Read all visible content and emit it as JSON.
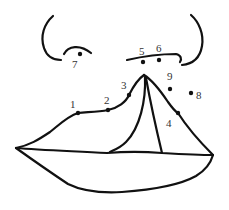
{
  "diagram": {
    "colors": {
      "line": "#111111",
      "label": "#333333",
      "background": "#ffffff"
    },
    "landmarks": [
      {
        "id": "1",
        "label": "1"
      },
      {
        "id": "2",
        "label": "2"
      },
      {
        "id": "3",
        "label": "3"
      },
      {
        "id": "4",
        "label": "4"
      },
      {
        "id": "5",
        "label": "5"
      },
      {
        "id": "6",
        "label": "6"
      },
      {
        "id": "7",
        "label": "7"
      },
      {
        "id": "8",
        "label": "8"
      },
      {
        "id": "9",
        "label": "9"
      }
    ]
  }
}
